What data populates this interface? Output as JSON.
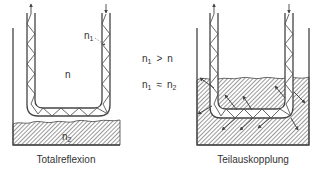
{
  "diagram": {
    "left_panel": {
      "caption": "Totalreflexion",
      "label_core": "n",
      "label_cladding": "n",
      "label_cladding_sub": "1",
      "label_medium": "n",
      "label_medium_sub": "2"
    },
    "right_panel": {
      "caption": "Teilauskopplung"
    },
    "conditions": {
      "line1": {
        "lhs": "n",
        "lhs_sub": "1",
        "op": ">",
        "rhs": "n",
        "rhs_sub": ""
      },
      "line2": {
        "lhs": "n",
        "lhs_sub": "1",
        "op": "≈",
        "rhs": "n",
        "rhs_sub": "2"
      }
    },
    "colors": {
      "stroke": "#444444",
      "hatch": "#666666",
      "background": "#ffffff"
    }
  }
}
